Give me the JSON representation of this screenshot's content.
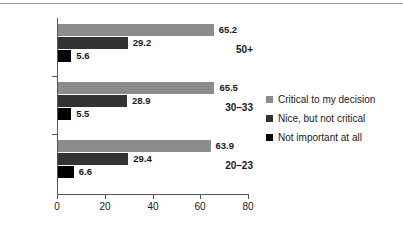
{
  "chart_data": {
    "type": "bar",
    "orientation": "horizontal",
    "title": "",
    "subtitle": "",
    "xlabel": "",
    "ylabel": "",
    "categories": [
      "50+",
      "30–33",
      "20–23"
    ],
    "series": [
      {
        "name": "Critical to my decision",
        "color": "#8c8c8c",
        "values": [
          65.2,
          65.5,
          63.9
        ]
      },
      {
        "name": "Nice, but not critical",
        "color": "#323232",
        "values": [
          29.2,
          28.9,
          29.4
        ]
      },
      {
        "name": "Not important at all",
        "color": "#000000",
        "values": [
          5.6,
          5.5,
          6.6
        ]
      }
    ],
    "xlim": [
      0,
      80
    ],
    "xticks": [
      0,
      20,
      40,
      60,
      80
    ],
    "xtick_labels": [
      "0",
      "20",
      "40",
      "60",
      "80"
    ],
    "grid": false,
    "legend_position": "right",
    "data_labels": [
      [
        "65.2",
        "29.2",
        "5.6"
      ],
      [
        "65.5",
        "28.9",
        "5.5"
      ],
      [
        "63.9",
        "29.4",
        "6.6"
      ]
    ]
  },
  "legend": {
    "items": [
      {
        "label": "Critical to my decision"
      },
      {
        "label": "Nice, but not critical"
      },
      {
        "label": "Not important at all"
      }
    ]
  },
  "axis": {
    "x_tick_labels": [
      "0",
      "20",
      "40",
      "60",
      "80"
    ],
    "y_category_labels": [
      "50+",
      "30–33",
      "20–23"
    ]
  }
}
